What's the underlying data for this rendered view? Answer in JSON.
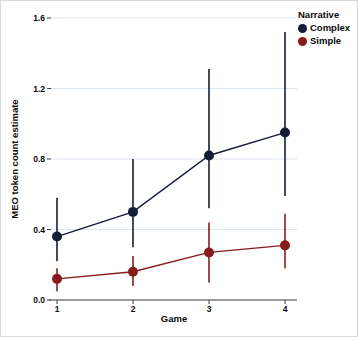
{
  "colors": {
    "background": "#ffffff",
    "grid": "#dbe7f0",
    "axis": "#3f3f3f",
    "text": "#0a0a0a"
  },
  "chart_data": {
    "type": "line",
    "title": "",
    "xlabel": "Game",
    "ylabel": "MEO token count estimate",
    "x_tick_labels": [
      "1",
      "2",
      "3",
      "4"
    ],
    "y_tick_labels": [
      "0.0",
      "0.4",
      "0.8",
      "1.2",
      "1.6"
    ],
    "y_tick_values": [
      0,
      0.4,
      0.8,
      1.2,
      1.6
    ],
    "ylim": [
      0,
      1.6
    ],
    "grid": "horizontal-only",
    "error_bars": true,
    "legend": {
      "title": "Narrative",
      "position": "top-right"
    },
    "series": [
      {
        "name": "Complex",
        "color": "#131d36",
        "values": [
          0.36,
          0.5,
          0.82,
          0.95
        ],
        "ci_lower": [
          0.22,
          0.3,
          0.52,
          0.59
        ],
        "ci_upper": [
          0.58,
          0.8,
          1.31,
          1.52
        ]
      },
      {
        "name": "Simple",
        "color": "#871b1b",
        "values": [
          0.12,
          0.16,
          0.27,
          0.31
        ],
        "ci_lower": [
          0.05,
          0.08,
          0.1,
          0.18
        ],
        "ci_upper": [
          0.18,
          0.25,
          0.44,
          0.49
        ]
      }
    ]
  }
}
